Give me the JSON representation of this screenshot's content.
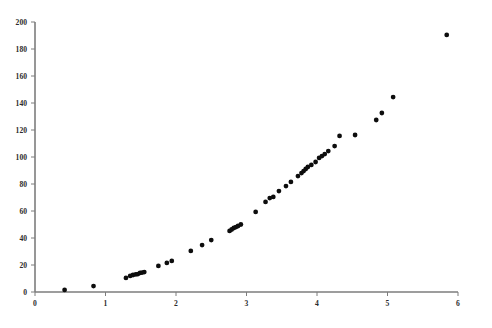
{
  "chart_data": {
    "type": "scatter",
    "title": "",
    "subtitle": "",
    "xlabel": "",
    "ylabel": "",
    "xlim": [
      0,
      6
    ],
    "ylim": [
      0,
      200
    ],
    "grid": false,
    "legend": null,
    "marker": {
      "shape": "circle",
      "color": "#0d0d0d",
      "size_px": 2.6
    },
    "x_ticks": [
      0,
      1,
      2,
      3,
      4,
      5,
      6
    ],
    "x_tick_labels": [
      "0",
      "1",
      "2",
      "3",
      "4",
      "5",
      "6"
    ],
    "y_ticks": [
      0,
      20,
      40,
      60,
      80,
      100,
      120,
      140,
      160,
      180,
      200
    ],
    "y_tick_labels": [
      "0",
      "20",
      "40",
      "60",
      "80",
      "100",
      "120",
      "140",
      "160",
      "180",
      "200"
    ],
    "series": [
      {
        "name": "series-1",
        "points": [
          [
            0.42,
            1.5
          ],
          [
            0.83,
            4.4
          ],
          [
            1.29,
            10.4
          ],
          [
            1.35,
            11.9
          ],
          [
            1.39,
            12.6
          ],
          [
            1.43,
            13.0
          ],
          [
            1.46,
            13.3
          ],
          [
            1.49,
            14.1
          ],
          [
            1.52,
            14.4
          ],
          [
            1.55,
            14.8
          ],
          [
            1.75,
            19.3
          ],
          [
            1.87,
            21.5
          ],
          [
            1.94,
            23.0
          ],
          [
            2.21,
            30.4
          ],
          [
            2.37,
            34.8
          ],
          [
            2.5,
            38.5
          ],
          [
            2.76,
            45.2
          ],
          [
            2.79,
            46.3
          ],
          [
            2.82,
            47.4
          ],
          [
            2.85,
            48.1
          ],
          [
            2.88,
            48.9
          ],
          [
            2.92,
            50.0
          ],
          [
            3.13,
            59.3
          ],
          [
            3.27,
            66.7
          ],
          [
            3.33,
            69.6
          ],
          [
            3.38,
            70.4
          ],
          [
            3.46,
            74.8
          ],
          [
            3.56,
            78.5
          ],
          [
            3.63,
            81.5
          ],
          [
            3.73,
            85.9
          ],
          [
            3.78,
            88.1
          ],
          [
            3.81,
            89.6
          ],
          [
            3.84,
            91.1
          ],
          [
            3.87,
            92.6
          ],
          [
            3.92,
            94.1
          ],
          [
            3.98,
            96.3
          ],
          [
            4.03,
            99.3
          ],
          [
            4.07,
            100.7
          ],
          [
            4.11,
            102.2
          ],
          [
            4.16,
            104.4
          ],
          [
            4.25,
            108.1
          ],
          [
            4.32,
            115.6
          ],
          [
            4.54,
            116.3
          ],
          [
            4.84,
            127.4
          ],
          [
            4.92,
            132.6
          ],
          [
            5.08,
            144.4
          ],
          [
            5.84,
            190.4
          ]
        ]
      }
    ]
  },
  "geometry": {
    "plot_left_px": 35,
    "plot_right_px": 458,
    "plot_bottom_px": 292,
    "plot_top_px": 22,
    "x_units_to_px": 70.5,
    "y_units_to_px": 1.35
  },
  "footer": {
    "ghost_text": ""
  }
}
